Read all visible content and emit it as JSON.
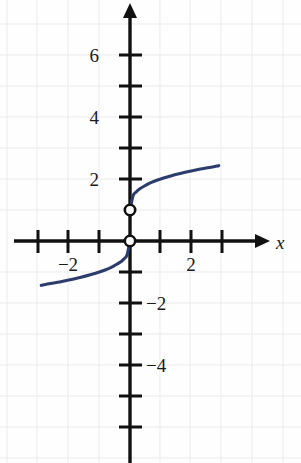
{
  "chart_data": {
    "type": "line",
    "title": "",
    "xlabel": "x",
    "ylabel": "",
    "grid": true,
    "legend": false,
    "xlim": [
      -3.6,
      3.5
    ],
    "ylim": [
      -6.2,
      6.9
    ],
    "x_ticks": [
      -3,
      -2,
      -1,
      1,
      2,
      3
    ],
    "y_ticks": [
      1,
      2,
      3,
      4,
      5,
      6,
      -1,
      -2,
      -3,
      -4,
      -5
    ],
    "x_tick_labels": [
      {
        "value": -2,
        "text": "−2"
      },
      {
        "value": 2,
        "text": "2"
      }
    ],
    "y_tick_labels": [
      {
        "value": 6,
        "text": "6"
      },
      {
        "value": 4,
        "text": "4"
      },
      {
        "value": 2,
        "text": "2"
      },
      {
        "value": -2,
        "text": "−2"
      },
      {
        "value": -4,
        "text": "−4"
      }
    ],
    "axis_label_x": "x",
    "curve_color": "#2c3c6d",
    "axis_color": "#111111",
    "grid_color": "#e9e9ec",
    "series": [
      {
        "name": "branch-negative",
        "description": "odd cube-root-like branch for x < 0, endpoint open at origin",
        "points": [
          [
            0,
            0
          ],
          [
            -0.1,
            -0.46
          ],
          [
            -0.2,
            -0.58
          ],
          [
            -0.3,
            -0.67
          ],
          [
            -0.5,
            -0.79
          ],
          [
            -0.7,
            -0.89
          ],
          [
            -1,
            -1
          ],
          [
            -1.3,
            -1.09
          ],
          [
            -1.6,
            -1.17
          ],
          [
            -2,
            -1.26
          ],
          [
            -2.3,
            -1.32
          ],
          [
            -2.6,
            -1.37
          ],
          [
            -2.9,
            -1.43
          ]
        ]
      },
      {
        "name": "branch-positive",
        "description": "same branch shifted up by 1 for x > 0, endpoint open at (0,1)",
        "points": [
          [
            0,
            1
          ],
          [
            0.1,
            1.46
          ],
          [
            0.2,
            1.58
          ],
          [
            0.3,
            1.67
          ],
          [
            0.5,
            1.79
          ],
          [
            0.7,
            1.89
          ],
          [
            1,
            2
          ],
          [
            1.3,
            2.09
          ],
          [
            1.6,
            2.17
          ],
          [
            2,
            2.26
          ],
          [
            2.3,
            2.32
          ],
          [
            2.6,
            2.37
          ],
          [
            2.9,
            2.43
          ]
        ]
      }
    ],
    "open_points": [
      {
        "x": 0,
        "y": 1,
        "label": "open circle at (0, 1)"
      },
      {
        "x": 0,
        "y": 0,
        "label": "open circle at origin (0, 0)"
      }
    ]
  },
  "annotations": {
    "x_axis_arrow": "arrow pointing right",
    "y_axis_arrow": "arrow pointing up"
  }
}
